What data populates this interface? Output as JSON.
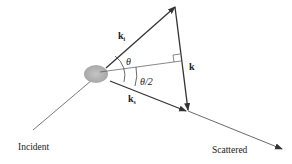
{
  "diagram": {
    "labels": {
      "k_incident": "k",
      "k_incident_sub": "i",
      "k_scattered": "k",
      "k_scattered_sub": "s",
      "k_transfer": "k",
      "theta": "θ",
      "half_theta": "θ/2",
      "incident": "Incident",
      "scattered": "Scattered"
    },
    "colors": {
      "line": "#333333",
      "scatterer": "#b8b8b8"
    }
  }
}
